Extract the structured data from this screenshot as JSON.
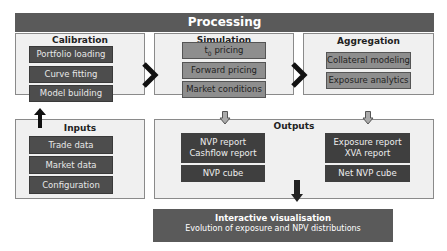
{
  "header": {
    "title": "Processing"
  },
  "calibration": {
    "title": "Calibration",
    "items": [
      "Portfolio loading",
      "Curve fitting",
      "Model building"
    ]
  },
  "simulation": {
    "title": "Simulation",
    "items": [
      {
        "main": "t",
        "sub": "0",
        "rest": " pricing"
      },
      {
        "label": "Forward pricing"
      },
      {
        "label": "Market conditions"
      }
    ]
  },
  "aggregation": {
    "title": "Aggregation",
    "items": [
      "Collateral modeling",
      "Exposure analytics"
    ]
  },
  "inputs": {
    "title": "Inputs",
    "items": [
      "Trade data",
      "Market data",
      "Configuration"
    ]
  },
  "outputs": {
    "title": "Outputs",
    "left": {
      "line1": "NVP report",
      "line2": "Cashflow report",
      "cube": "NVP cube"
    },
    "right": {
      "line1": "Exposure report",
      "line2": "XVA report",
      "cube": "Net NVP cube"
    }
  },
  "visualisation": {
    "title": "Interactive visualisation",
    "subtitle": "Evolution of exposure and NPV distributions"
  },
  "colors": {
    "header": "#5a5a5a",
    "panel": "#f0f0f0",
    "dark_box": "#4d4d4d",
    "mid_box": "#8e8e8e"
  }
}
